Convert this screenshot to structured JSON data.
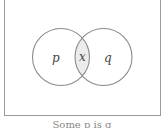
{
  "diagram": {
    "type": "venn",
    "sets": [
      {
        "name": "p",
        "label": "p"
      },
      {
        "name": "q",
        "label": "q"
      }
    ],
    "intersection": {
      "label": "x",
      "shaded": true,
      "fill": "#ececec"
    },
    "stroke_color": "#8a8a8a"
  },
  "caption": "Some p is q"
}
